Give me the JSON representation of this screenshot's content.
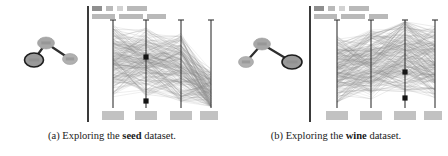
{
  "figure": {
    "width": 448,
    "height": 156,
    "background": "#ffffff",
    "divider_color": "#3a3a3a"
  },
  "subfigures": [
    {
      "id": "a",
      "caption_prefix": "(a) Exploring the",
      "caption_emphasis": "seed",
      "caption_suffix": "dataset.",
      "header_chips_row1": [
        {
          "name": "chip-label-1",
          "width": 10,
          "tone": "dark"
        },
        {
          "name": "chip-label-2",
          "width": 7,
          "tone": "normal"
        },
        {
          "name": "chip-label-3",
          "width": 6,
          "tone": "light"
        },
        {
          "name": "chip-label-4",
          "width": 20,
          "tone": "normal"
        }
      ],
      "header_chips_row2": [
        {
          "name": "chip-filter-1",
          "width": 23,
          "tone": "normal"
        },
        {
          "name": "chip-filter-2",
          "width": 24,
          "tone": "normal"
        },
        {
          "name": "chip-filter-3",
          "width": 19,
          "tone": "normal"
        }
      ],
      "nodelink": {
        "nodes": [
          {
            "name": "graph-node-hub",
            "cx": 40,
            "cy": 41,
            "rx": 8.5,
            "ry": 6.0,
            "fill": "#a7a7a7",
            "selected": false
          },
          {
            "name": "graph-node-selected",
            "cx": 28,
            "cy": 58,
            "rx": 9.5,
            "ry": 7.0,
            "fill": "#9a9a9a",
            "selected": true
          },
          {
            "name": "graph-node-leaf",
            "cx": 64,
            "cy": 57,
            "rx": 7.5,
            "ry": 5.5,
            "fill": "#b0b0b0",
            "selected": false
          }
        ],
        "edges": [
          {
            "name": "graph-edge-hub-selected",
            "x1": 40,
            "y1": 41,
            "x2": 28,
            "y2": 58
          },
          {
            "name": "graph-edge-hub-leaf",
            "x1": 40,
            "y1": 41,
            "x2": 64,
            "y2": 57
          }
        ]
      },
      "chart_data": {
        "type": "line",
        "title": "",
        "subtitle": "",
        "xlabel": "",
        "ylabel": "",
        "grid": false,
        "legend_position": "none",
        "axis_count": 4,
        "axis_x_positions": [
          22,
          55,
          90,
          120
        ],
        "axis_top": 18,
        "axis_bottom": 106,
        "categories": [
          "axis-1",
          "axis-2",
          "axis-3",
          "axis-4"
        ],
        "axis_tick_labels": [
          "",
          "",
          "",
          ""
        ],
        "line_color": "#8c8c8c",
        "line_count": 210,
        "markers": [
          {
            "name": "brush-marker-upper",
            "axis": 2,
            "x": 55,
            "y": 55
          },
          {
            "name": "brush-marker-lower",
            "axis": 2,
            "x": 55,
            "y": 99
          }
        ],
        "series": [
          {
            "name": "cluster-high",
            "values": [
              0.72,
              0.68,
              0.62,
              0.22
            ]
          },
          {
            "name": "cluster-mid",
            "values": [
              0.55,
              0.52,
              0.48,
              0.18
            ]
          },
          {
            "name": "cluster-low",
            "values": [
              0.34,
              0.36,
              0.3,
              0.12
            ]
          }
        ],
        "ylim": [
          0,
          1
        ]
      },
      "axis_bottom_labels": [
        {
          "name": "axis-label-1",
          "x": 22
        },
        {
          "name": "axis-label-2",
          "x": 55
        },
        {
          "name": "axis-label-3",
          "x": 90
        },
        {
          "name": "axis-label-4",
          "x": 120
        }
      ]
    },
    {
      "id": "b",
      "caption_prefix": "(b) Exploring the",
      "caption_emphasis": "wine",
      "caption_suffix": "dataset.",
      "header_chips_row1": [
        {
          "name": "chip-label-1",
          "width": 10,
          "tone": "dark"
        },
        {
          "name": "chip-label-2",
          "width": 7,
          "tone": "normal"
        },
        {
          "name": "chip-label-3",
          "width": 6,
          "tone": "light"
        },
        {
          "name": "chip-label-4",
          "width": 20,
          "tone": "normal"
        }
      ],
      "header_chips_row2": [
        {
          "name": "chip-filter-1",
          "width": 23,
          "tone": "normal"
        },
        {
          "name": "chip-filter-2",
          "width": 24,
          "tone": "normal"
        },
        {
          "name": "chip-filter-3",
          "width": 19,
          "tone": "normal"
        }
      ],
      "nodelink": {
        "nodes": [
          {
            "name": "graph-node-hub",
            "cx": 32,
            "cy": 42,
            "rx": 8.5,
            "ry": 6.0,
            "fill": "#a7a7a7",
            "selected": false
          },
          {
            "name": "graph-node-leaf",
            "cx": 16,
            "cy": 60,
            "rx": 7.5,
            "ry": 5.5,
            "fill": "#b0b0b0",
            "selected": false
          },
          {
            "name": "graph-node-selected",
            "cx": 62,
            "cy": 60,
            "rx": 10.0,
            "ry": 7.0,
            "fill": "#9a9a9a",
            "selected": true
          }
        ],
        "edges": [
          {
            "name": "graph-edge-hub-leaf",
            "x1": 32,
            "y1": 42,
            "x2": 16,
            "y2": 60
          },
          {
            "name": "graph-edge-hub-selected",
            "x1": 32,
            "y1": 42,
            "x2": 62,
            "y2": 60
          }
        ]
      },
      "chart_data": {
        "type": "line",
        "title": "",
        "subtitle": "",
        "xlabel": "",
        "ylabel": "",
        "grid": false,
        "legend_position": "none",
        "axis_count": 4,
        "axis_x_positions": [
          24,
          58,
          92,
          122
        ],
        "axis_top": 18,
        "axis_bottom": 106,
        "categories": [
          "axis-1",
          "axis-2",
          "axis-3",
          "axis-4"
        ],
        "axis_tick_labels": [
          "",
          "",
          "",
          ""
        ],
        "line_color": "#8c8c8c",
        "line_count": 230,
        "markers": [
          {
            "name": "brush-marker-upper",
            "axis": 3,
            "x": 92,
            "y": 70
          },
          {
            "name": "brush-marker-lower",
            "axis": 3,
            "x": 92,
            "y": 96
          }
        ],
        "series": [
          {
            "name": "cluster-high",
            "values": [
              0.6,
              0.66,
              0.8,
              0.7
            ]
          },
          {
            "name": "cluster-mid",
            "values": [
              0.45,
              0.5,
              0.58,
              0.52
            ]
          },
          {
            "name": "cluster-low",
            "values": [
              0.28,
              0.32,
              0.4,
              0.34
            ]
          }
        ],
        "ylim": [
          0,
          1
        ]
      },
      "axis_bottom_labels": [
        {
          "name": "axis-label-1",
          "x": 24
        },
        {
          "name": "axis-label-2",
          "x": 58
        },
        {
          "name": "axis-label-3",
          "x": 92
        },
        {
          "name": "axis-label-4",
          "x": 122
        }
      ]
    }
  ]
}
